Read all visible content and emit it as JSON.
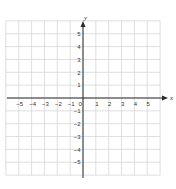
{
  "chart_data": {
    "type": "coordinate-grid",
    "title": "",
    "xlabel": "x",
    "ylabel": "y",
    "xlim": [
      -6,
      6
    ],
    "ylim": [
      -6,
      6
    ],
    "grid": true,
    "x_tick_labels": [
      "-5",
      "-4",
      "-3",
      "-2",
      "-1",
      "0",
      "1",
      "2",
      "3",
      "4",
      "5"
    ],
    "y_tick_labels": [
      "5",
      "4",
      "3",
      "2",
      "1",
      "-1",
      "-2",
      "-3",
      "-4",
      "-5"
    ],
    "series": []
  },
  "axes": {
    "x_label": "x",
    "y_label": "y",
    "origin_label": "0",
    "x_ticks": [
      {
        "v": -5,
        "label": "−5"
      },
      {
        "v": -4,
        "label": "−4"
      },
      {
        "v": -3,
        "label": "−3"
      },
      {
        "v": -2,
        "label": "−2"
      },
      {
        "v": -1,
        "label": "−1"
      },
      {
        "v": 1,
        "label": "1"
      },
      {
        "v": 2,
        "label": "2"
      },
      {
        "v": 3,
        "label": "3"
      },
      {
        "v": 4,
        "label": "4"
      },
      {
        "v": 5,
        "label": "5"
      }
    ],
    "y_ticks": [
      {
        "v": 5,
        "label": "5"
      },
      {
        "v": 4,
        "label": "4"
      },
      {
        "v": 3,
        "label": "3"
      },
      {
        "v": 2,
        "label": "2"
      },
      {
        "v": 1,
        "label": "1"
      },
      {
        "v": -1,
        "label": "−1"
      },
      {
        "v": -2,
        "label": "−2"
      },
      {
        "v": -3,
        "label": "−3"
      },
      {
        "v": -4,
        "label": "−4"
      },
      {
        "v": -5,
        "label": "−5"
      }
    ]
  },
  "colors": {
    "grid": "#d6d6d6",
    "axis": "#2a2a2a",
    "text": "#333333"
  }
}
